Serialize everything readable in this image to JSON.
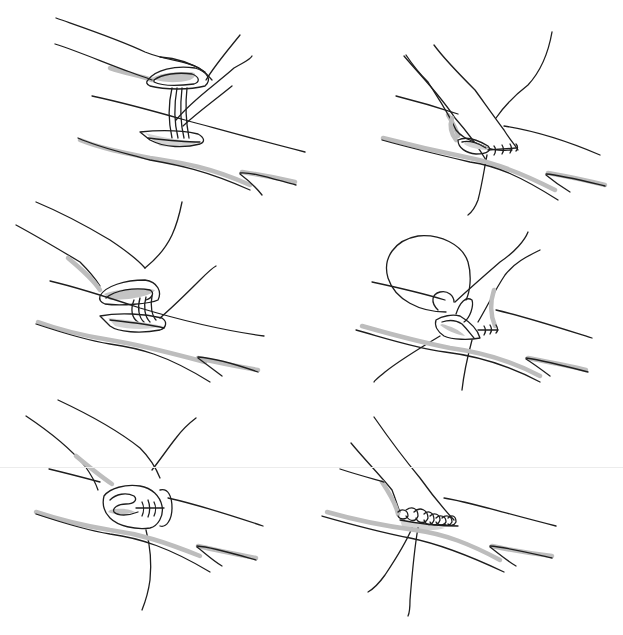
{
  "figure": {
    "layout": {
      "rows": 3,
      "cols": 2
    },
    "colors": {
      "background": "#ffffff",
      "ink": "#1e1e1e",
      "shading": "#bdbdbd"
    },
    "panels": [
      {
        "id": 1,
        "position": "top-left",
        "content": "fingers holding wound edge, needle passing two thread loops through elliptical wound"
      },
      {
        "id": 2,
        "position": "top-right",
        "content": "finger pinching wound edge, row of three stitches along closed edge, thread hanging down"
      },
      {
        "id": 3,
        "position": "middle-left",
        "content": "folded wound edge held by finger, three thread loops wrapped through everted edge"
      },
      {
        "id": 4,
        "position": "middle-right",
        "content": "large thread loop above wound, edge folded inward, stitches at wound end"
      },
      {
        "id": 5,
        "position": "bottom-left",
        "content": "finger holding inverted wound edge, cross stitches in middle, single thread trailing down"
      },
      {
        "id": 6,
        "position": "bottom-right",
        "content": "completed continuous suture line with multiple loops, two thread ends trailing down"
      }
    ]
  }
}
